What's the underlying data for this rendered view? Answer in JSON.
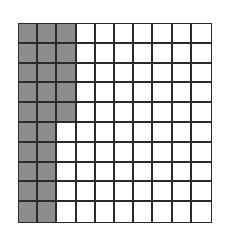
{
  "figure": {
    "type": "hundred-grid",
    "rows": 10,
    "columns": 10,
    "total_cells": 100,
    "shaded_cells": 25,
    "shading": {
      "full_columns": [
        1,
        2
      ],
      "partial_column": 3,
      "partial_column_rows": 5
    },
    "colors": {
      "shaded": "#9a9a9a",
      "unshaded": "#ffffff",
      "grid_lines": "#2a2a2a"
    }
  }
}
